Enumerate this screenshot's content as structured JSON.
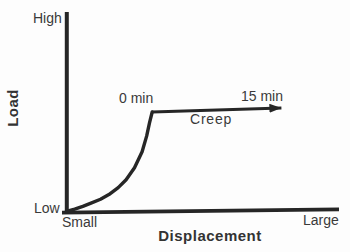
{
  "figure": {
    "y_axis_title": "Load",
    "x_axis_title": "Displacement",
    "y_max_label": "High",
    "y_min_label": "Low",
    "x_min_label": "Small",
    "x_max_label": "Large",
    "creep_start_label": "0 min",
    "creep_end_label": "15 min",
    "creep_label": "Creep"
  },
  "colors": {
    "line": "#262626",
    "text": "#3a3a3a",
    "background": "#fdfdfd"
  },
  "chart_data": {
    "type": "line",
    "title": "",
    "xlabel": "Displacement",
    "ylabel": "Load",
    "x_tick_labels": [
      "Small",
      "Large"
    ],
    "y_tick_labels": [
      "Low",
      "High"
    ],
    "axis_ranges": {
      "x_norm": [
        0,
        1
      ],
      "y_norm": [
        0,
        1
      ]
    },
    "grid": false,
    "legend": false,
    "series": [
      {
        "name": "loading-curve",
        "style": "solid",
        "x": [
          0,
          0.03,
          0.06,
          0.09,
          0.125,
          0.156,
          0.19,
          0.219,
          0.25,
          0.278,
          0.295,
          0.305,
          0.315
        ],
        "y": [
          0,
          0.012,
          0.026,
          0.042,
          0.062,
          0.085,
          0.12,
          0.16,
          0.22,
          0.3,
          0.38,
          0.445,
          0.5
        ]
      },
      {
        "name": "creep-plateau-arrow",
        "style": "arrow",
        "x": [
          0.315,
          0.79
        ],
        "y": [
          0.5,
          0.52
        ]
      }
    ],
    "annotations": [
      {
        "text": "0 min",
        "x_norm": 0.24,
        "y_norm": 0.57,
        "anchor": "start of creep plateau"
      },
      {
        "text": "15 min",
        "x_norm": 0.71,
        "y_norm": 0.58,
        "anchor": "end of creep arrow"
      },
      {
        "text": "Creep",
        "x_norm": 0.56,
        "y_norm": 0.45,
        "anchor": "below creep arrow"
      }
    ]
  }
}
